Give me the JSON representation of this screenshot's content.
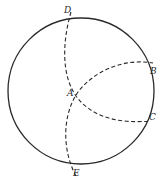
{
  "diagram": {
    "title": "",
    "circle": {
      "cx": 81,
      "cy": 91,
      "r": 73,
      "stroke": "#2a2a2a"
    },
    "arcs": [
      {
        "name": "arc-D-A-C",
        "style": "dashed"
      },
      {
        "name": "arc-E-A-B",
        "style": "dashed"
      }
    ],
    "labels": {
      "D": "D",
      "A": "A",
      "B": "B",
      "C": "C",
      "E": "E"
    }
  }
}
